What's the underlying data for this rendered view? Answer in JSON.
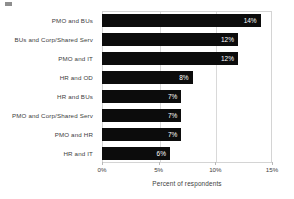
{
  "chart_data": {
    "type": "bar",
    "orientation": "horizontal",
    "title": "",
    "xlabel": "Percent of respondents",
    "ylabel": "",
    "xlim": [
      0,
      15
    ],
    "xtick_labels": [
      "0%",
      "5%",
      "10%",
      "15%"
    ],
    "xticks": [
      0,
      5,
      10,
      15
    ],
    "grid": true,
    "legend": false,
    "categories": [
      "PMO and BUs",
      "BUs and  Corp/Shared Serv",
      "PMO and IT",
      "HR and  OD",
      "HR and BUs",
      "PMO and  Corp/Shared Serv",
      "PMO and  HR",
      "HR and  IT"
    ],
    "values": [
      14,
      12,
      12,
      8,
      7,
      7,
      7,
      6
    ],
    "value_labels": [
      "14%",
      "12%",
      "12%",
      "8%",
      "7%",
      "7%",
      "7%",
      "6%"
    ],
    "bar_color": "#0c0c0c",
    "value_label_color": "#ffffff",
    "gridline_color": "#d9d9d9",
    "axis_color": "#d4d4d4",
    "text_color": "#3d3d3d"
  }
}
